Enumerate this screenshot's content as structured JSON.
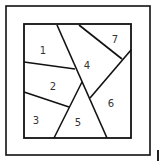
{
  "diagram": {
    "type": "partitioned-square",
    "stroke_color": "#111111",
    "outer_frame": {
      "x": 6,
      "y": 6,
      "w": 144,
      "h": 149
    },
    "inner_frame": {
      "x": 24,
      "y": 24,
      "w": 107,
      "h": 114
    },
    "regions": [
      {
        "id": 1,
        "label": "1",
        "x": 43,
        "y": 54
      },
      {
        "id": 2,
        "label": "2",
        "x": 53,
        "y": 90
      },
      {
        "id": 3,
        "label": "3",
        "x": 36,
        "y": 124
      },
      {
        "id": 4,
        "label": "4",
        "x": 87,
        "y": 69
      },
      {
        "id": 5,
        "label": "5",
        "x": 78,
        "y": 126
      },
      {
        "id": 6,
        "label": "6",
        "x": 111,
        "y": 107
      },
      {
        "id": 7,
        "label": "7",
        "x": 115,
        "y": 43
      }
    ],
    "lines": [
      {
        "x1": 57,
        "y1": 25,
        "x2": 107,
        "y2": 138
      },
      {
        "x1": 24,
        "y1": 62,
        "x2": 75,
        "y2": 69
      },
      {
        "x1": 24,
        "y1": 92,
        "x2": 69,
        "y2": 107
      },
      {
        "x1": 82,
        "y1": 82,
        "x2": 54,
        "y2": 138
      },
      {
        "x1": 79,
        "y1": 25,
        "x2": 122,
        "y2": 59
      },
      {
        "x1": 131,
        "y1": 50,
        "x2": 90,
        "y2": 98
      }
    ]
  }
}
